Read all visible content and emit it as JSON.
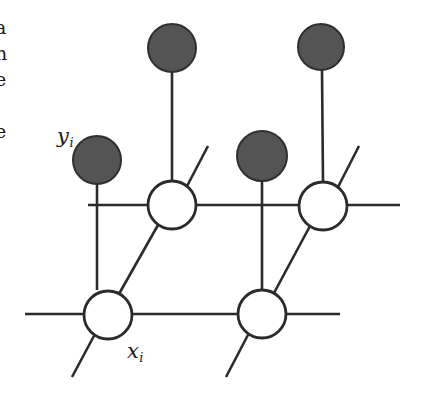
{
  "figure": {
    "name": "lattice-graphical-model",
    "width": 422,
    "height": 393,
    "background_color": "#ffffff",
    "stroke_color": "#2b2b2b",
    "filled_node_color": "#545454",
    "open_node_color": "#ffffff"
  },
  "labels": {
    "latent_label": {
      "base": "x",
      "subscript": "i",
      "x": 127,
      "y": 341
    },
    "observed_label": {
      "base": "y",
      "subscript": "i",
      "x": 57,
      "y": 126
    }
  },
  "margin_text_fragments": [
    "a",
    "n",
    "e",
    "i",
    "e"
  ],
  "nodes": {
    "observed": [
      {
        "name": "observed-node-top-left",
        "cx": 172,
        "cy": 48,
        "r": 24,
        "shaded": true
      },
      {
        "name": "observed-node-top-right",
        "cx": 321,
        "cy": 47,
        "r": 23,
        "shaded": true
      },
      {
        "name": "observed-node-middle",
        "cx": 262,
        "cy": 156,
        "r": 25,
        "shaded": true
      },
      {
        "name": "observed-node-left",
        "cx": 97,
        "cy": 160,
        "r": 24,
        "shaded": true
      }
    ],
    "latent": [
      {
        "name": "latent-node-upper-left",
        "cx": 172,
        "cy": 205,
        "r": 24,
        "shaded": false
      },
      {
        "name": "latent-node-upper-right",
        "cx": 323,
        "cy": 206,
        "r": 24,
        "shaded": false
      },
      {
        "name": "latent-node-lower-left",
        "cx": 108,
        "cy": 315,
        "r": 24,
        "shaded": false
      },
      {
        "name": "latent-node-lower-right",
        "cx": 262,
        "cy": 314,
        "r": 24,
        "shaded": false
      }
    ]
  },
  "edges": [
    {
      "name": "edge-rail-upper",
      "x1": 88,
      "y1": 205,
      "x2": 400,
      "y2": 205,
      "kind": "horizontal"
    },
    {
      "name": "edge-rail-lower",
      "x1": 25,
      "y1": 314,
      "x2": 340,
      "y2": 314,
      "kind": "horizontal"
    },
    {
      "name": "edge-observed-top-left-to-latent-upper-left",
      "x1": 172,
      "y1": 72,
      "x2": 172,
      "y2": 181,
      "kind": "vertical"
    },
    {
      "name": "edge-observed-top-right-to-latent-upper-right",
      "x1": 322,
      "y1": 70,
      "x2": 323,
      "y2": 182,
      "kind": "vertical"
    },
    {
      "name": "edge-observed-middle-to-latent-lower-right",
      "x1": 262,
      "y1": 181,
      "x2": 262,
      "y2": 290,
      "kind": "vertical"
    },
    {
      "name": "edge-observed-left-to-rail-upper",
      "x1": 97,
      "y1": 184,
      "x2": 97,
      "y2": 290,
      "kind": "vertical"
    },
    {
      "name": "edge-latent-lower-left-to-latent-upper-left",
      "x1": 119,
      "y1": 294,
      "x2": 158,
      "y2": 225,
      "kind": "diagonal"
    },
    {
      "name": "edge-latent-lower-right-to-latent-upper-right",
      "x1": 274,
      "y1": 293,
      "x2": 310,
      "y2": 226,
      "kind": "diagonal"
    },
    {
      "name": "stub-upper-left-up-right",
      "x1": 186,
      "y1": 188,
      "x2": 208,
      "y2": 146,
      "kind": "diagonal-stub"
    },
    {
      "name": "stub-upper-right-up-right",
      "x1": 337,
      "y1": 189,
      "x2": 359,
      "y2": 146,
      "kind": "diagonal-stub"
    },
    {
      "name": "stub-lower-left-down-left",
      "x1": 95,
      "y1": 334,
      "x2": 72,
      "y2": 377,
      "kind": "diagonal-stub"
    },
    {
      "name": "stub-lower-right-down-left",
      "x1": 249,
      "y1": 333,
      "x2": 226,
      "y2": 377,
      "kind": "diagonal-stub"
    }
  ]
}
